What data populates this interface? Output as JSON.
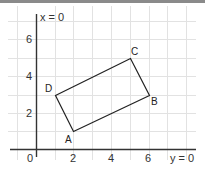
{
  "diagram": {
    "type": "coordinate-geometry",
    "axes": {
      "vertical_label": "x = 0",
      "horizontal_label": "y = 0",
      "origin_label": "0",
      "x_ticks": [
        "2",
        "4",
        "6"
      ],
      "y_ticks": [
        "2",
        "4",
        "6"
      ]
    },
    "shape": {
      "name": "rectangle ABCD",
      "vertices": [
        {
          "label": "A",
          "x": 2,
          "y": 1
        },
        {
          "label": "B",
          "x": 6,
          "y": 3
        },
        {
          "label": "C",
          "x": 5,
          "y": 5
        },
        {
          "label": "D",
          "x": 1,
          "y": 3
        }
      ]
    },
    "colors": {
      "grid": "#e2e2e2",
      "axis": "#333333",
      "shape": "#222222",
      "topbar": "#8a8a8a"
    }
  }
}
